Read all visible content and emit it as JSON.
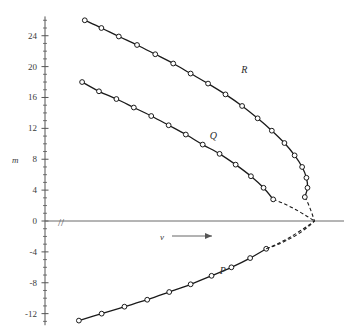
{
  "chart_data": {
    "type": "line",
    "title": "",
    "xlabel": "ν",
    "ylabel": "m",
    "xlabel_arrow": "⟶",
    "grid": false,
    "legend": "inline-curve-labels",
    "y_axis": {
      "tick_labels": [
        "24",
        "20",
        "16",
        "12",
        "8",
        "4",
        "0",
        "-4",
        "-8",
        "-12"
      ],
      "tick_values": [
        24,
        20,
        16,
        12,
        8,
        4,
        0,
        -4,
        -8,
        -12
      ],
      "minor_tick_step": 1,
      "ylim": [
        -13.5,
        26.5
      ]
    },
    "x_axis": {
      "tick_labels": [],
      "break_symbol": "//",
      "xlim": [
        0,
        1
      ]
    },
    "annotations": [
      {
        "text": "R",
        "x": 0.68,
        "y": 19.2
      },
      {
        "text": "Q",
        "x": 0.565,
        "y": 10.6
      },
      {
        "text": "P",
        "x": 0.6,
        "y": -6.9
      }
    ],
    "series": [
      {
        "name": "R",
        "label": "R",
        "marker": "open-circle",
        "color": "#1a1a1a",
        "points": [
          {
            "x": 0.085,
            "y": 26.0
          },
          {
            "x": 0.147,
            "y": 25.0
          },
          {
            "x": 0.212,
            "y": 23.9
          },
          {
            "x": 0.28,
            "y": 22.8
          },
          {
            "x": 0.348,
            "y": 21.6
          },
          {
            "x": 0.415,
            "y": 20.4
          },
          {
            "x": 0.48,
            "y": 19.1
          },
          {
            "x": 0.545,
            "y": 17.8
          },
          {
            "x": 0.61,
            "y": 16.4
          },
          {
            "x": 0.672,
            "y": 14.9
          },
          {
            "x": 0.73,
            "y": 13.3
          },
          {
            "x": 0.783,
            "y": 11.7
          },
          {
            "x": 0.83,
            "y": 10.1
          },
          {
            "x": 0.868,
            "y": 8.5
          },
          {
            "x": 0.896,
            "y": 7.0
          },
          {
            "x": 0.912,
            "y": 5.6
          },
          {
            "x": 0.916,
            "y": 4.3
          },
          {
            "x": 0.906,
            "y": 3.1
          }
        ]
      },
      {
        "name": "Q",
        "label": "Q",
        "marker": "open-circle",
        "color": "#1a1a1a",
        "points": [
          {
            "x": 0.075,
            "y": 18.0
          },
          {
            "x": 0.138,
            "y": 16.8
          },
          {
            "x": 0.203,
            "y": 15.8
          },
          {
            "x": 0.268,
            "y": 14.7
          },
          {
            "x": 0.333,
            "y": 13.6
          },
          {
            "x": 0.398,
            "y": 12.4
          },
          {
            "x": 0.462,
            "y": 11.2
          },
          {
            "x": 0.525,
            "y": 9.9
          },
          {
            "x": 0.588,
            "y": 8.7
          },
          {
            "x": 0.648,
            "y": 7.3
          },
          {
            "x": 0.705,
            "y": 5.8
          },
          {
            "x": 0.752,
            "y": 4.3
          },
          {
            "x": 0.788,
            "y": 2.8
          }
        ]
      },
      {
        "name": "P",
        "label": "P",
        "marker": "open-circle",
        "color": "#1a1a1a",
        "points": [
          {
            "x": 0.063,
            "y": -12.9
          },
          {
            "x": 0.148,
            "y": -12.0
          },
          {
            "x": 0.233,
            "y": -11.1
          },
          {
            "x": 0.318,
            "y": -10.2
          },
          {
            "x": 0.4,
            "y": -9.2
          },
          {
            "x": 0.48,
            "y": -8.2
          },
          {
            "x": 0.558,
            "y": -7.1
          },
          {
            "x": 0.632,
            "y": -6.0
          },
          {
            "x": 0.702,
            "y": -4.8
          },
          {
            "x": 0.762,
            "y": -3.6
          }
        ]
      }
    ],
    "convergence_point": {
      "x": 0.942,
      "y": 0.0
    },
    "dashed_tails": true
  }
}
